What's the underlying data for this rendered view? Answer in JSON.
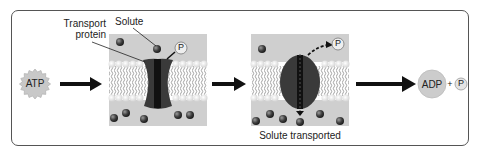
{
  "diagram": {
    "labels": {
      "atp": "ATP",
      "transport_protein_line1": "Transport",
      "transport_protein_line2": "protein",
      "solute": "Solute",
      "phosphate": "P",
      "solute_transported": "Solute transported",
      "adp": "ADP",
      "plus": "+",
      "phosphate_final": "P"
    },
    "colors": {
      "frame_border": "#555555",
      "membrane_bg": "#cfcfcf",
      "protein_dark": "#3a3a3a",
      "protein_core": "#111111",
      "molecule": "#444444",
      "atp_star": "#c8c8c8",
      "adp_circle": "#cccccc",
      "arrow": "#111111"
    },
    "steps": [
      {
        "name": "atp-input",
        "text": "ATP"
      },
      {
        "name": "protein-binds-solute",
        "text": "Transport protein with bound solute and phosphate"
      },
      {
        "name": "protein-changes-shape",
        "text": "Solute transported"
      },
      {
        "name": "products",
        "text": "ADP + P"
      }
    ]
  }
}
